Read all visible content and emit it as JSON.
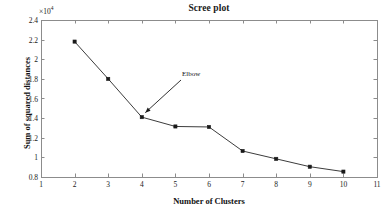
{
  "chart_data": {
    "type": "line",
    "title": "Scree plot",
    "xlabel": "Number of Clusters",
    "ylabel": "Sum of squared distances",
    "y_multiplier": "×10",
    "y_multiplier_exponent": "4",
    "x": [
      2,
      3,
      4,
      5,
      6,
      7,
      8,
      9,
      10
    ],
    "values": [
      21800,
      18000,
      14100,
      13150,
      13100,
      10650,
      9850,
      9050,
      8550
    ],
    "values_scaled": [
      2.18,
      1.8,
      1.41,
      1.315,
      1.31,
      1.065,
      0.985,
      0.905,
      0.855
    ],
    "xlim": [
      1,
      11
    ],
    "ylim": [
      0.8,
      2.4
    ],
    "xticks": [
      "1",
      "2",
      "3",
      "4",
      "5",
      "6",
      "7",
      "8",
      "9",
      "10",
      "11"
    ],
    "yticks": [
      "0.8",
      "1",
      "1.2",
      "1.4",
      "1.6",
      "1.8",
      "2",
      "2.2",
      "2.4"
    ],
    "grid": false,
    "legend": false,
    "marker": "square",
    "line_color": "#3c3c3c",
    "marker_color": "#1a1a1a",
    "axis_color": "#8c8c8c",
    "background": "#ffffff",
    "annotations": [
      {
        "text": "Elbow",
        "points_to_x": 4,
        "points_to_y": 1.41
      }
    ]
  }
}
